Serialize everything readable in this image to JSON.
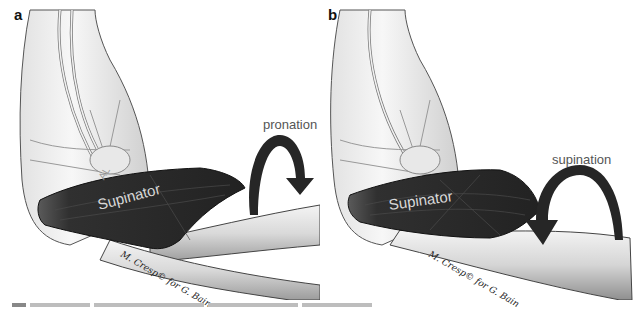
{
  "figure": {
    "panels": [
      {
        "letter": "a",
        "muscle_label": "Supinator",
        "ligament_label": "AL",
        "motion_label": "pronation",
        "arrow_direction": "clockwise-down-right",
        "credit": "M. Cresp© for G. Bain"
      },
      {
        "letter": "b",
        "muscle_label": "Supinator",
        "motion_label": "supination",
        "arrow_direction": "counterclockwise-down-left",
        "credit": "M. Cresp© for G. Bain"
      }
    ],
    "caption": "",
    "colors": {
      "muscle": "#2b2b2b",
      "bone": "#e6e6e6",
      "arrow": "#262626",
      "motion_text": "#555555",
      "label_text": "#d8d8d8"
    }
  }
}
